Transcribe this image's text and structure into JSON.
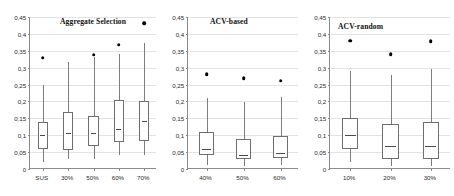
{
  "figure": {
    "width": 454,
    "height": 196,
    "background": "#ffffff",
    "marker_color": "#000000",
    "box_line_color": "#6e6e6e",
    "grid_color": "#e3e3e3",
    "axis_color": "#8a8a8a"
  },
  "chart_data": [
    {
      "type": "box",
      "title": "Aggregate Selection",
      "xlabel": "",
      "ylabel": "",
      "ylim": [
        0,
        0.45
      ],
      "grid": true,
      "legend": "none",
      "ytick_labels": [
        "0,45",
        "0,4",
        "0,35",
        "0,3",
        "0,25",
        "0,2",
        "0,15",
        "0,1",
        "0,05",
        "0"
      ],
      "ytick_values": [
        0.45,
        0.4,
        0.35,
        0.3,
        0.25,
        0.2,
        0.15,
        0.1,
        0.05,
        0
      ],
      "categories": [
        "SUS",
        "30%",
        "50%",
        "60%",
        "70%"
      ],
      "boxes": [
        {
          "category": "SUS",
          "whisker_low": 0.021,
          "q1": 0.058,
          "median": 0.101,
          "q3": 0.139,
          "whisker_high": 0.25,
          "point": 0.329
        },
        {
          "category": "30%",
          "whisker_low": 0.029,
          "q1": 0.057,
          "median": 0.108,
          "q3": 0.17,
          "whisker_high": 0.318,
          "point": null
        },
        {
          "category": "50%",
          "whisker_low": 0.03,
          "q1": 0.067,
          "median": 0.108,
          "q3": 0.158,
          "whisker_high": 0.332,
          "point": 0.338
        },
        {
          "category": "60%",
          "whisker_low": 0.04,
          "q1": 0.079,
          "median": 0.119,
          "q3": 0.204,
          "whisker_high": 0.341,
          "point": 0.368
        },
        {
          "category": "70%",
          "whisker_low": 0.041,
          "q1": 0.082,
          "median": 0.143,
          "q3": 0.202,
          "whisker_high": 0.372,
          "point": 0.432
        }
      ]
    },
    {
      "type": "box",
      "title": "ACV-based",
      "xlabel": "",
      "ylabel": "",
      "ylim": [
        0,
        0.45
      ],
      "grid": true,
      "legend": "none",
      "ytick_labels": [
        "0,45",
        "0,4",
        "0,35",
        "0,3",
        "0,25",
        "0,2",
        "0,15",
        "0,1",
        "0,05",
        "0"
      ],
      "ytick_values": [
        0.45,
        0.4,
        0.35,
        0.3,
        0.25,
        0.2,
        0.15,
        0.1,
        0.05,
        0
      ],
      "categories": [
        "40%",
        "50%",
        "60%"
      ],
      "boxes": [
        {
          "category": "40%",
          "whisker_low": 0.012,
          "q1": 0.041,
          "median": 0.06,
          "q3": 0.109,
          "whisker_high": 0.209,
          "point": 0.28
        },
        {
          "category": "50%",
          "whisker_low": 0.01,
          "q1": 0.031,
          "median": 0.04,
          "q3": 0.09,
          "whisker_high": 0.199,
          "point": 0.268
        },
        {
          "category": "60%",
          "whisker_low": 0.011,
          "q1": 0.032,
          "median": 0.047,
          "q3": 0.099,
          "whisker_high": 0.212,
          "point": 0.262
        }
      ]
    },
    {
      "type": "box",
      "title": "ACV-random",
      "xlabel": "",
      "ylabel": "",
      "ylim": [
        0,
        0.45
      ],
      "grid": true,
      "legend": "none",
      "ytick_labels": [
        "0,45",
        "0,4",
        "0,35",
        "0,3",
        "0,25",
        "0,2",
        "0,15",
        "0,1",
        "0,05",
        "0"
      ],
      "ytick_values": [
        0.45,
        0.4,
        0.35,
        0.3,
        0.25,
        0.2,
        0.15,
        0.1,
        0.05,
        0
      ],
      "categories": [
        "10%",
        "20%",
        "30%"
      ],
      "boxes": [
        {
          "category": "10%",
          "whisker_low": 0.022,
          "q1": 0.06,
          "median": 0.1,
          "q3": 0.15,
          "whisker_high": 0.29,
          "point": 0.38
        },
        {
          "category": "20%",
          "whisker_low": 0.01,
          "q1": 0.03,
          "median": 0.069,
          "q3": 0.133,
          "whisker_high": 0.278,
          "point": 0.34
        },
        {
          "category": "30%",
          "whisker_low": 0.01,
          "q1": 0.029,
          "median": 0.068,
          "q3": 0.139,
          "whisker_high": 0.297,
          "point": 0.378
        }
      ]
    }
  ]
}
